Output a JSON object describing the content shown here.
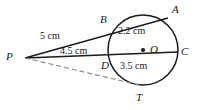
{
  "figure": {
    "type": "circle-geometry-diagram",
    "stroke_color": "#1a1a1a",
    "dashed_color": "#8a8a8a",
    "background": "#ffffff"
  },
  "points": [
    {
      "id": "P",
      "label": "P",
      "x": 25,
      "y": 58,
      "role": "external-point",
      "label_x": 6,
      "label_y": 51
    },
    {
      "id": "A",
      "label": "A",
      "x": 168,
      "y": 18,
      "role": "on-circle",
      "label_x": 172,
      "label_y": 4
    },
    {
      "id": "B",
      "label": "B",
      "x": 111,
      "y": 26,
      "role": "on-circle",
      "label_x": 100,
      "label_y": 14
    },
    {
      "id": "C",
      "label": "C",
      "x": 178,
      "y": 52,
      "role": "on-circle",
      "label_x": 181,
      "label_y": 46
    },
    {
      "id": "D",
      "label": "D",
      "x": 110,
      "y": 56,
      "role": "on-circle",
      "label_x": 101,
      "label_y": 60
    },
    {
      "id": "T",
      "label": "T",
      "x": 139,
      "y": 85,
      "role": "tangent-point",
      "label_x": 136,
      "label_y": 92
    },
    {
      "id": "O",
      "label": "O",
      "x": 143,
      "y": 50,
      "role": "center",
      "label_x": 150,
      "label_y": 44
    }
  ],
  "circle": {
    "center_x": 143,
    "center_y": 50,
    "radius": 35,
    "center_dot_radius": 2.1
  },
  "segments": [
    {
      "id": "PA",
      "name": "secant-p-a",
      "from": "P",
      "to": "A",
      "style": "solid"
    },
    {
      "id": "PC",
      "name": "secant-p-c",
      "from": "P",
      "to": "C",
      "style": "solid"
    },
    {
      "id": "PT",
      "name": "tangent-p-t",
      "from": "P",
      "to": "T",
      "style": "dashed"
    }
  ],
  "measurements": [
    {
      "id": "PB",
      "text": "5 cm",
      "x": 40,
      "y": 31,
      "segment": "P-B"
    },
    {
      "id": "PD",
      "text": "4.5 cm",
      "x": 60,
      "y": 46,
      "segment": "P-D"
    },
    {
      "id": "BA",
      "text": "2.2 cm",
      "x": 118,
      "y": 26,
      "segment": "B-A"
    },
    {
      "id": "DC",
      "text": "3.5 cm",
      "x": 120,
      "y": 61,
      "segment": "D-C"
    }
  ]
}
